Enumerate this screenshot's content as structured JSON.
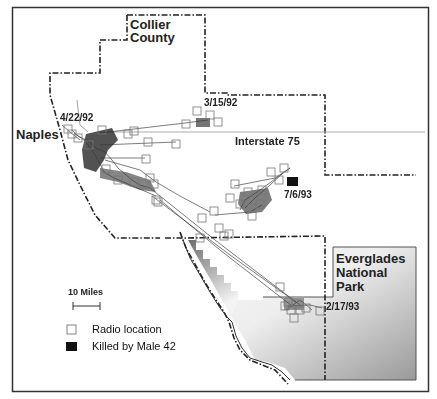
{
  "map": {
    "region_labels": {
      "county": [
        "Collier",
        "County"
      ],
      "city": "Naples",
      "highway": "Interstate 75",
      "park": [
        "Everglades",
        "National",
        "Park"
      ]
    },
    "date_labels": {
      "start": "4/22/92",
      "cluster_north": "3/15/92",
      "death": "7/6/93",
      "cluster_south": "2/17/93"
    },
    "scale_bar": {
      "label": "10 Miles"
    },
    "legend": {
      "items": [
        {
          "symbol": "open-square",
          "label": "Radio location"
        },
        {
          "symbol": "filled-square",
          "label": "Killed by Male 42"
        }
      ]
    },
    "colors": {
      "frame": "#333333",
      "boundary": "#222222",
      "track": "#555555",
      "marker": "#777777",
      "kill_marker": "#111111",
      "interstate": "#aaaaaa",
      "park_dark": "#7a7a7a",
      "park_light": "#f2f2f2"
    }
  }
}
